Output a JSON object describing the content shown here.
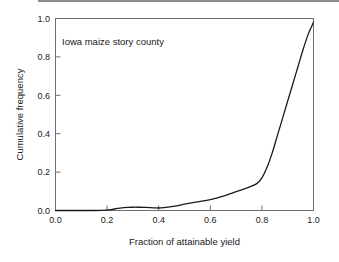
{
  "figure": {
    "background_color": "#ffffff",
    "frame_color": "#6e6e6e",
    "curve_color": "#1a1a1a",
    "text_color": "#1a1a1a",
    "top_rule_color": "#8c8c8c"
  },
  "chart_data": {
    "type": "line",
    "title": "",
    "annotation": "Iowa maize story county",
    "xlabel": "Fraction of attainable yield",
    "ylabel": "Cumulative frequency",
    "xlim": [
      0.0,
      1.0
    ],
    "ylim": [
      0.0,
      1.0
    ],
    "xticks": [
      0.0,
      0.2,
      0.4,
      0.6,
      0.8,
      1.0
    ],
    "yticks": [
      0.0,
      0.2,
      0.4,
      0.6,
      0.8,
      1.0
    ],
    "xticklabels": [
      "0.0",
      "0.2",
      "0.4",
      "0.6",
      "0.8",
      "1.0"
    ],
    "yticklabels": [
      "0.0",
      "0.2",
      "0.4",
      "0.6",
      "0.8",
      "1.0"
    ],
    "grid": false,
    "legend": false,
    "series": [
      {
        "name": "Cumulative frequency of attainable yield fraction",
        "x": [
          0.0,
          0.05,
          0.1,
          0.15,
          0.2,
          0.22,
          0.25,
          0.28,
          0.3,
          0.32,
          0.35,
          0.38,
          0.4,
          0.42,
          0.45,
          0.48,
          0.5,
          0.55,
          0.6,
          0.65,
          0.7,
          0.73,
          0.75,
          0.78,
          0.8,
          0.82,
          0.84,
          0.86,
          0.88,
          0.9,
          0.92,
          0.94,
          0.96,
          0.98,
          1.0
        ],
        "y": [
          0.0,
          0.0,
          0.0,
          0.0,
          0.002,
          0.006,
          0.012,
          0.016,
          0.017,
          0.017,
          0.016,
          0.014,
          0.013,
          0.015,
          0.02,
          0.027,
          0.033,
          0.045,
          0.057,
          0.075,
          0.098,
          0.112,
          0.122,
          0.14,
          0.17,
          0.225,
          0.3,
          0.39,
          0.48,
          0.57,
          0.66,
          0.75,
          0.84,
          0.92,
          0.98
        ]
      }
    ]
  },
  "axes": {
    "x_tick_labels": [
      "0.0",
      "0.2",
      "0.4",
      "0.6",
      "0.8",
      "1.0"
    ],
    "y_tick_labels": [
      "0.0",
      "0.2",
      "0.4",
      "0.6",
      "0.8",
      "1.0"
    ],
    "x_title": "Fraction of attainable yield",
    "y_title": "Cumulative frequency"
  }
}
